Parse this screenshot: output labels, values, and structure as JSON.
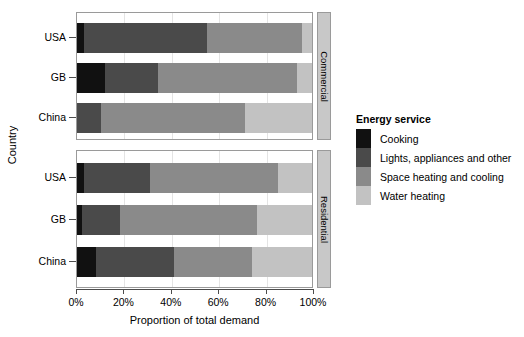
{
  "chart_data": {
    "type": "bar",
    "orientation": "horizontal",
    "stacked": true,
    "normalized": true,
    "title": "",
    "xlabel": "Proportion of total demand",
    "ylabel": "Country",
    "xlim": [
      0,
      100
    ],
    "xticks": [
      "0%",
      "20%",
      "40%",
      "60%",
      "80%",
      "100%"
    ],
    "xtick_values": [
      0,
      20,
      40,
      60,
      80,
      100
    ],
    "grid": true,
    "legend_title": "Energy service",
    "legend_position": "right",
    "series": [
      {
        "name": "Cooking",
        "color": "#111111"
      },
      {
        "name": "Lights, appliances and other",
        "color": "#4a4a4a"
      },
      {
        "name": "Space heating and cooling",
        "color": "#8a8a8a"
      },
      {
        "name": "Water heating",
        "color": "#c2c2c2"
      }
    ],
    "categories": [
      "USA",
      "GB",
      "China"
    ],
    "panels": [
      {
        "name": "Commercial",
        "bars": [
          {
            "category": "USA",
            "values": [
              3,
              52,
              40,
              5
            ]
          },
          {
            "category": "GB",
            "values": [
              12,
              22,
              59,
              7
            ]
          },
          {
            "category": "China",
            "values": [
              0,
              10,
              61,
              29
            ]
          }
        ]
      },
      {
        "name": "Residential",
        "bars": [
          {
            "category": "USA",
            "values": [
              3,
              28,
              54,
              15
            ]
          },
          {
            "category": "GB",
            "values": [
              2,
              16,
              58,
              24
            ]
          },
          {
            "category": "China",
            "values": [
              8,
              33,
              33,
              26
            ]
          }
        ]
      }
    ]
  },
  "axes": {
    "y_title": "Country",
    "x_title": "Proportion of total demand"
  },
  "legend": {
    "title": "Energy service",
    "items": [
      {
        "label": "Cooking",
        "color": "#111111"
      },
      {
        "label": "Lights, appliances and other",
        "color": "#4a4a4a"
      },
      {
        "label": "Space heating and cooling",
        "color": "#8a8a8a"
      },
      {
        "label": "Water heating",
        "color": "#c2c2c2"
      }
    ]
  },
  "strips": [
    {
      "label": "Commercial"
    },
    {
      "label": "Residential"
    }
  ]
}
